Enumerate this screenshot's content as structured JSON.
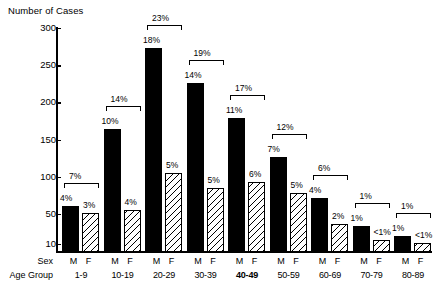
{
  "chart_data": {
    "type": "bar",
    "title": "",
    "ylabel": "Number of Cases",
    "xlabel_rows": [
      "Sex",
      "Age Group"
    ],
    "categories": [
      "1-9",
      "10-19",
      "20-29",
      "30-39",
      "40-49",
      "50-59",
      "60-69",
      "70-79",
      "80-89"
    ],
    "sex_labels": [
      "M",
      "F"
    ],
    "ylim": [
      0,
      300
    ],
    "yticks": [
      10,
      50,
      100,
      150,
      200,
      250,
      300
    ],
    "ytick_labels": [
      "10",
      "50",
      "100",
      "150",
      "200",
      "250",
      "300"
    ],
    "grid": false,
    "legend": "none",
    "series": [
      {
        "name": "M",
        "values": [
          62,
          165,
          274,
          227,
          180,
          128,
          72,
          35,
          22
        ]
      },
      {
        "name": "F",
        "values": [
          52,
          57,
          106,
          86,
          94,
          79,
          38,
          16,
          12
        ]
      }
    ],
    "percent_labels": {
      "male": [
        "4%",
        "10%",
        "18%",
        "14%",
        "11%",
        "7%",
        "4%",
        "1%",
        "1%"
      ],
      "female": [
        "3%",
        "4%",
        "5%",
        "5%",
        "6%",
        "5%",
        "2%",
        "<1%",
        "<1%"
      ],
      "total": [
        "7%",
        "14%",
        "23%",
        "19%",
        "17%",
        "12%",
        "6%",
        "1%",
        "1%"
      ]
    },
    "bold_age_groups": [
      "40-49"
    ],
    "colors": {
      "male_bar": "#000000",
      "female_bar_fill": "#ffffff",
      "female_bar_hatch": "#000000",
      "axis": "#000000",
      "text": "#000000",
      "background": "#ffffff"
    }
  }
}
